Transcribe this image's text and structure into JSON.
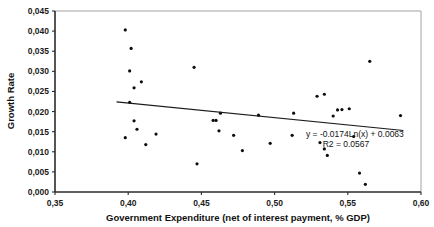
{
  "chart_data": {
    "type": "scatter",
    "title": "",
    "xlabel": "Government Expenditure (net of interest payment, % GDP)",
    "ylabel": "Growth Rate",
    "xlim": [
      0.35,
      0.6
    ],
    "ylim": [
      0.0,
      0.045
    ],
    "xticks": [
      0.35,
      0.4,
      0.45,
      0.5,
      0.55,
      0.6
    ],
    "yticks": [
      0.0,
      0.005,
      0.01,
      0.015,
      0.02,
      0.025,
      0.03,
      0.035,
      0.04,
      0.045
    ],
    "xtick_labels": [
      "0,35",
      "0,40",
      "0,45",
      "0,50",
      "0,55",
      "0,60"
    ],
    "ytick_labels": [
      "0,000",
      "0,005",
      "0,010",
      "0,015",
      "0,020",
      "0,025",
      "0,030",
      "0,035",
      "0,040",
      "0,045"
    ],
    "grid": false,
    "legend": null,
    "annotations": [
      "y = -0.0174Ln(x) + 0.0063",
      "R2 = 0.0567"
    ],
    "trendline": {
      "type": "logarithmic",
      "equation": "y = -0.0174Ln(x) + 0.0063",
      "r_squared": 0.0567,
      "coefficient": -0.0174,
      "intercept": 0.0063,
      "x_start": 0.392,
      "y_start": 0.0224,
      "x_end": 0.588,
      "y_end": 0.0153
    },
    "points": [
      {
        "x": 0.398,
        "y": 0.0403
      },
      {
        "x": 0.402,
        "y": 0.0357
      },
      {
        "x": 0.401,
        "y": 0.0301
      },
      {
        "x": 0.404,
        "y": 0.0259
      },
      {
        "x": 0.409,
        "y": 0.0274
      },
      {
        "x": 0.401,
        "y": 0.0223
      },
      {
        "x": 0.404,
        "y": 0.0177
      },
      {
        "x": 0.406,
        "y": 0.0156
      },
      {
        "x": 0.398,
        "y": 0.0135
      },
      {
        "x": 0.412,
        "y": 0.0118
      },
      {
        "x": 0.419,
        "y": 0.0144
      },
      {
        "x": 0.445,
        "y": 0.031
      },
      {
        "x": 0.447,
        "y": 0.007
      },
      {
        "x": 0.458,
        "y": 0.0178
      },
      {
        "x": 0.46,
        "y": 0.0178
      },
      {
        "x": 0.463,
        "y": 0.0196
      },
      {
        "x": 0.462,
        "y": 0.0152
      },
      {
        "x": 0.472,
        "y": 0.0141
      },
      {
        "x": 0.478,
        "y": 0.0103
      },
      {
        "x": 0.489,
        "y": 0.0191
      },
      {
        "x": 0.497,
        "y": 0.0121
      },
      {
        "x": 0.513,
        "y": 0.0196
      },
      {
        "x": 0.512,
        "y": 0.0141
      },
      {
        "x": 0.529,
        "y": 0.0238
      },
      {
        "x": 0.534,
        "y": 0.0243
      },
      {
        "x": 0.531,
        "y": 0.0123
      },
      {
        "x": 0.534,
        "y": 0.0107
      },
      {
        "x": 0.543,
        "y": 0.0204
      },
      {
        "x": 0.546,
        "y": 0.0205
      },
      {
        "x": 0.551,
        "y": 0.0207
      },
      {
        "x": 0.54,
        "y": 0.0189
      },
      {
        "x": 0.536,
        "y": 0.0091
      },
      {
        "x": 0.554,
        "y": 0.0138
      },
      {
        "x": 0.558,
        "y": 0.0047
      },
      {
        "x": 0.562,
        "y": 0.0019
      },
      {
        "x": 0.565,
        "y": 0.0325
      },
      {
        "x": 0.586,
        "y": 0.019
      }
    ]
  },
  "axis_titles": {
    "x": "Government Expenditure (net of interest payment, % GDP)",
    "y": "Growth Rate"
  },
  "equation_text": {
    "line1": "y = -0.0174Ln(x) + 0.0063",
    "line2": "R2 = 0.0567"
  },
  "colors": {
    "point": "#0d0d0d",
    "trendline": "#1a1a1a",
    "axis": "#2b2b2b",
    "frame": "#8a8a8a",
    "background": "#ffffff"
  }
}
